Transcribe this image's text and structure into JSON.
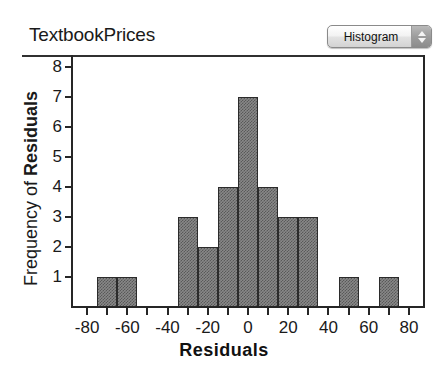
{
  "header": {
    "title": "TextbookPrices",
    "plot_type_selector": {
      "label": "Histogram",
      "icon": "stepper-updown-icon",
      "options": [
        "Histogram"
      ]
    }
  },
  "chart_data": {
    "type": "bar",
    "title": "TextbookPrices",
    "xlabel": "Residuals",
    "ylabel": "Frequency of Residuals",
    "ylabel_plain": "Frequency of ",
    "ylabel_bold": "Residuals",
    "xlim": [
      -88,
      88
    ],
    "ylim": [
      0,
      8.4
    ],
    "xtick_step": 20,
    "xminor_step": 10,
    "grid": false,
    "legend": null,
    "bin_width": 10,
    "xticks": [
      -80,
      -60,
      -40,
      -20,
      0,
      20,
      40,
      60,
      80
    ],
    "xtick_labels": [
      "-80",
      "-60",
      "-40",
      "-20",
      "0",
      "20",
      "40",
      "60",
      "80"
    ],
    "yticks": [
      1,
      2,
      3,
      4,
      5,
      6,
      7,
      8
    ],
    "ytick_labels": [
      "1",
      "2",
      "3",
      "4",
      "5",
      "6",
      "7",
      "8"
    ],
    "bar_color": "#888888",
    "bar_edge_color": "#2b2b2b",
    "bins": [
      {
        "start": -75,
        "end": -65,
        "count": 1
      },
      {
        "start": -65,
        "end": -55,
        "count": 1
      },
      {
        "start": -35,
        "end": -25,
        "count": 3
      },
      {
        "start": -25,
        "end": -15,
        "count": 2
      },
      {
        "start": -15,
        "end": -5,
        "count": 4
      },
      {
        "start": -5,
        "end": 5,
        "count": 7
      },
      {
        "start": 5,
        "end": 15,
        "count": 4
      },
      {
        "start": 15,
        "end": 25,
        "count": 3
      },
      {
        "start": 25,
        "end": 35,
        "count": 3
      },
      {
        "start": 45,
        "end": 55,
        "count": 1
      },
      {
        "start": 65,
        "end": 75,
        "count": 1
      }
    ],
    "total_count": 30
  }
}
